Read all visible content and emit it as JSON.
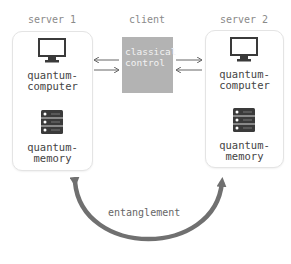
{
  "diagram": {
    "nodes": {
      "server1": {
        "title": "server 1",
        "computer_label": "quantum-\ncomputer",
        "computer_line1": "quantum-",
        "computer_line2": "computer",
        "memory_line1": "quantum-",
        "memory_line2": "memory",
        "computer_icon": "monitor-icon",
        "memory_icon": "server-rack-icon"
      },
      "client": {
        "title": "client",
        "box_line1": "classical",
        "box_line2": "control"
      },
      "server2": {
        "title": "server 2",
        "computer_line1": "quantum-",
        "computer_line2": "computer",
        "memory_line1": "quantum-",
        "memory_line2": "memory",
        "computer_icon": "monitor-icon",
        "memory_icon": "server-rack-icon"
      }
    },
    "edges": [
      {
        "from": "client",
        "to": "server1",
        "type": "arrow",
        "style": "thin"
      },
      {
        "from": "server1",
        "to": "client",
        "type": "arrow",
        "style": "thin"
      },
      {
        "from": "client",
        "to": "server2",
        "type": "arrow",
        "style": "thin"
      },
      {
        "from": "server2",
        "to": "client",
        "type": "arrow",
        "style": "thin"
      },
      {
        "from": "server1",
        "to": "server2",
        "type": "bidirectional-arc",
        "label": "entanglement"
      }
    ],
    "entanglement_label": "entanglement",
    "colors": {
      "client_fill": "#b3b3b3",
      "arc": "#707070",
      "icon_dark": "#3a3a3a",
      "text": "#444444",
      "muted_text": "#8a8a8a"
    }
  }
}
